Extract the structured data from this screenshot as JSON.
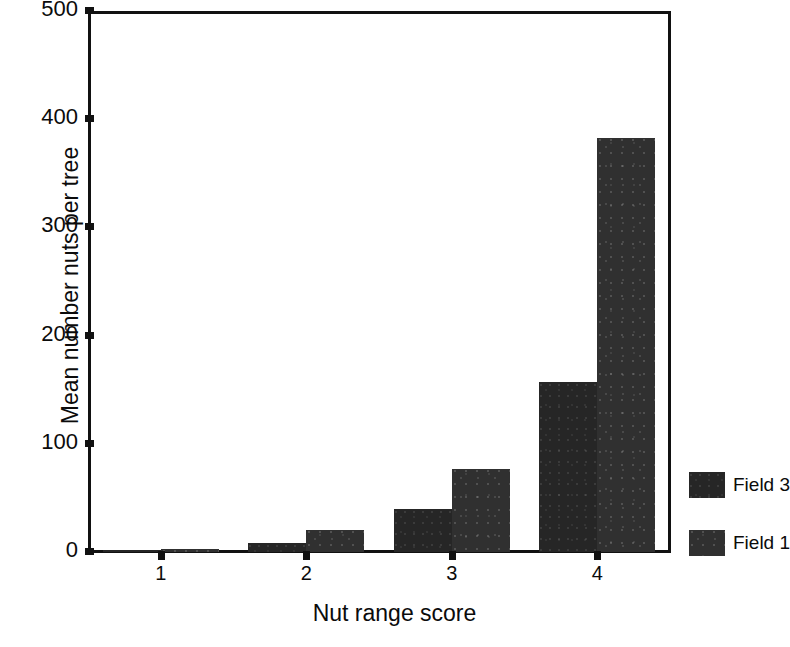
{
  "chart_data": {
    "type": "bar",
    "title": "",
    "xlabel": "Nut range score",
    "ylabel": "Mean number nuts per tree",
    "categories": [
      "1",
      "2",
      "3",
      "4"
    ],
    "series": [
      {
        "name": "Field 3",
        "color": "#262626",
        "values": [
          1,
          8,
          40,
          157
        ]
      },
      {
        "name": "Field 1",
        "color": "#303030",
        "values": [
          3,
          20,
          77,
          383
        ]
      }
    ],
    "ylim": [
      0,
      500
    ],
    "yticks": [
      0,
      100,
      200,
      300,
      400,
      500
    ],
    "ytick_labels": [
      "0",
      "100",
      "200",
      "300",
      "400",
      "500"
    ],
    "xtick_labels": [
      "1",
      "2",
      "3",
      "4"
    ],
    "grid": false,
    "legend_position": "right"
  },
  "legend": {
    "entries": [
      {
        "label": "Field 3"
      },
      {
        "label": "Field 1"
      }
    ]
  }
}
